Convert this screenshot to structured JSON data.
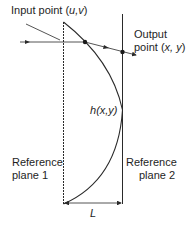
{
  "labels": {
    "input_point_prefix": "Input point (",
    "input_point_vars": "u,v",
    "input_point_suffix": ")",
    "output_line1": "Output",
    "output_prefix": "point (",
    "output_vars": "x, y",
    "output_suffix": ")",
    "height_func": "h",
    "height_args": "(x,y)",
    "ref1_line1": "Reference",
    "ref1_line2": "plane 1",
    "ref2_line1": "Reference",
    "ref2_line2": "plane 2",
    "length": "L"
  },
  "colors": {
    "line": "#2a2a2a",
    "background": "#ffffff"
  }
}
